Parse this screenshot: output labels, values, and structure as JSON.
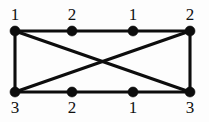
{
  "diagram": {
    "type": "graph",
    "background_color": "#fdfdfd",
    "line_color": "#0d0d0d",
    "vertex_color": "#0d0d0d",
    "canvas": {
      "width": 209,
      "height": 122
    },
    "vertices": [
      {
        "id": "tl",
        "label": "1",
        "x": 15,
        "y": 31,
        "label_x": 15,
        "label_y": 6,
        "row": "top",
        "position": "left"
      },
      {
        "id": "tm1",
        "label": "2",
        "x": 72,
        "y": 31,
        "label_x": 72,
        "label_y": 6,
        "row": "top",
        "position": "mid-left"
      },
      {
        "id": "tm2",
        "label": "1",
        "x": 133,
        "y": 31,
        "label_x": 133,
        "label_y": 6,
        "row": "top",
        "position": "mid-right"
      },
      {
        "id": "tr",
        "label": "2",
        "x": 190,
        "y": 31,
        "label_x": 190,
        "label_y": 6,
        "row": "top",
        "position": "right"
      },
      {
        "id": "bl",
        "label": "3",
        "x": 15,
        "y": 92,
        "label_x": 15,
        "label_y": 99,
        "row": "bottom",
        "position": "left"
      },
      {
        "id": "bm1",
        "label": "2",
        "x": 72,
        "y": 92,
        "label_x": 72,
        "label_y": 99,
        "row": "bottom",
        "position": "mid-left"
      },
      {
        "id": "bm2",
        "label": "1",
        "x": 133,
        "y": 92,
        "label_x": 133,
        "label_y": 99,
        "row": "bottom",
        "position": "mid-right"
      },
      {
        "id": "br",
        "label": "3",
        "x": 190,
        "y": 92,
        "label_x": 190,
        "label_y": 99,
        "row": "bottom",
        "position": "right"
      }
    ],
    "vertex_radius": 5,
    "edges": [
      {
        "id": "top-edge",
        "from": "tl",
        "to": "tr",
        "kind": "horizontal"
      },
      {
        "id": "bottom-edge",
        "from": "bl",
        "to": "br",
        "kind": "horizontal"
      },
      {
        "id": "left-edge",
        "from": "tl",
        "to": "bl",
        "kind": "vertical"
      },
      {
        "id": "right-edge",
        "from": "tr",
        "to": "br",
        "kind": "vertical"
      },
      {
        "id": "diagonal-down",
        "from": "tl",
        "to": "br",
        "kind": "diagonal"
      },
      {
        "id": "diagonal-up",
        "from": "bl",
        "to": "tr",
        "kind": "diagonal"
      }
    ],
    "crossing_point": {
      "x": 103,
      "y": 61
    }
  }
}
